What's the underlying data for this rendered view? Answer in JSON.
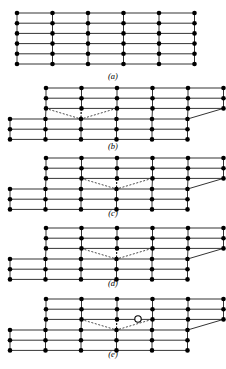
{
  "figure": {
    "title": "",
    "width": 226,
    "height": 369,
    "colors": {
      "atom_fill": "#000000",
      "atom_open_fill": "#ffffff",
      "bond": "#000000",
      "background": "#ffffff"
    },
    "panels": [
      {
        "id": "a",
        "label": "(a)",
        "label_x": 113,
        "label_y": 79,
        "caption_note": "perfect lattice"
      },
      {
        "id": "b",
        "label": "(b)",
        "label_x": 113,
        "label_y": 149,
        "caption_note": "edge dislocation at left position"
      },
      {
        "id": "c",
        "label": "(c)",
        "label_x": 113,
        "label_y": 216,
        "caption_note": "dislocation moved one step right"
      },
      {
        "id": "d",
        "label": "(d)",
        "label_x": 113,
        "label_y": 286,
        "caption_note": "dislocation moved further right"
      },
      {
        "id": "e",
        "label": "(e)",
        "label_x": 113,
        "label_y": 357,
        "caption_note": "vacancy shown as open circle"
      }
    ],
    "geometry": {
      "dot_radius": 2.3,
      "open_dot_radius": 3.2,
      "open_dot_stroke": 1.1,
      "bond_width": 0.8,
      "dashed_bond_width": 0.7,
      "dash_pattern": "2,1.6",
      "col_spacing": 35.5,
      "row_spacing": 10.2
    },
    "panel_a": {
      "origin_x": 17,
      "origin_y": 13,
      "cols": 6,
      "rows": 6
    },
    "panel_b": {
      "top_origin_x": 46,
      "top_origin_y": 88,
      "top_cols": 6,
      "top_rows": 3,
      "bottom_origin_x": 10,
      "bottom_origin_y": 119,
      "bottom_cols": 6,
      "bottom_rows": 3,
      "apex_col": 2
    },
    "panel_c": {
      "top_origin_x": 46,
      "top_origin_y": 158,
      "bottom_origin_x": 10,
      "bottom_origin_y": 189,
      "apex_col": 3
    },
    "panel_d": {
      "top_origin_x": 46,
      "top_origin_y": 228,
      "bottom_origin_x": 10,
      "bottom_origin_y": 259,
      "apex_col": 3
    },
    "panel_e": {
      "top_origin_x": 46,
      "top_origin_y": 299,
      "bottom_origin_x": 10,
      "bottom_origin_y": 330,
      "apex_col": 3,
      "open_circle_x": 138,
      "open_circle_y": 319
    }
  }
}
